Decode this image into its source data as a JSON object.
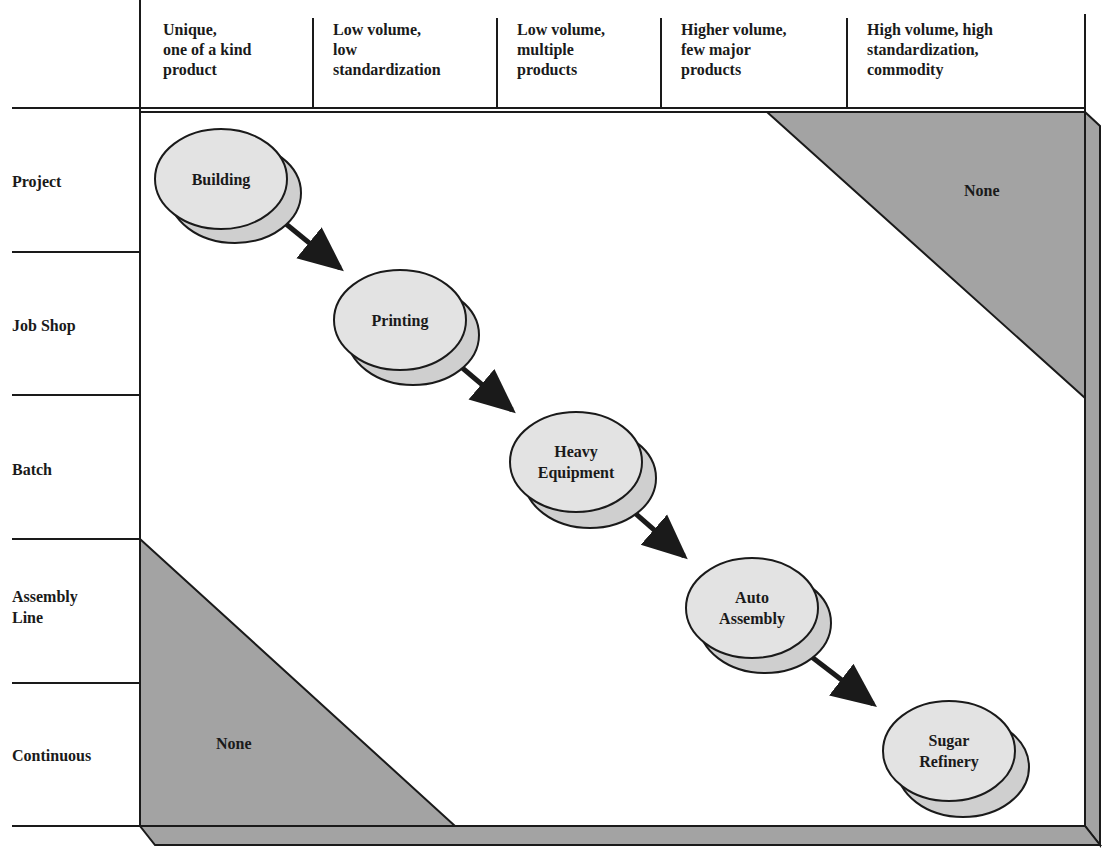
{
  "diagram": {
    "columns": [
      {
        "label": "Unique,\none of a kind\nproduct"
      },
      {
        "label": "Low volume,\nlow\nstandardization"
      },
      {
        "label": "Low volume,\nmultiple\nproducts"
      },
      {
        "label": "Higher volume,\nfew major\nproducts"
      },
      {
        "label": "High volume, high\nstandardization,\ncommodity"
      }
    ],
    "rows": [
      {
        "label": "Project"
      },
      {
        "label": "Job Shop"
      },
      {
        "label": "Batch"
      },
      {
        "label": "Assembly\nLine"
      },
      {
        "label": "Continuous"
      }
    ],
    "nodes": [
      {
        "label": "Building"
      },
      {
        "label": "Printing"
      },
      {
        "label": "Heavy\nEquipment"
      },
      {
        "label": "Auto\nAssembly"
      },
      {
        "label": "Sugar\nRefinery"
      }
    ],
    "shaded_regions": [
      {
        "position": "top-right",
        "label": "None"
      },
      {
        "position": "bottom-left",
        "label": "None"
      }
    ],
    "colors": {
      "shade": "#a3a3a3",
      "node_fill": "#e3e3e3",
      "node_shadow": "#cfcfcf",
      "line": "#1a1a1a"
    }
  }
}
